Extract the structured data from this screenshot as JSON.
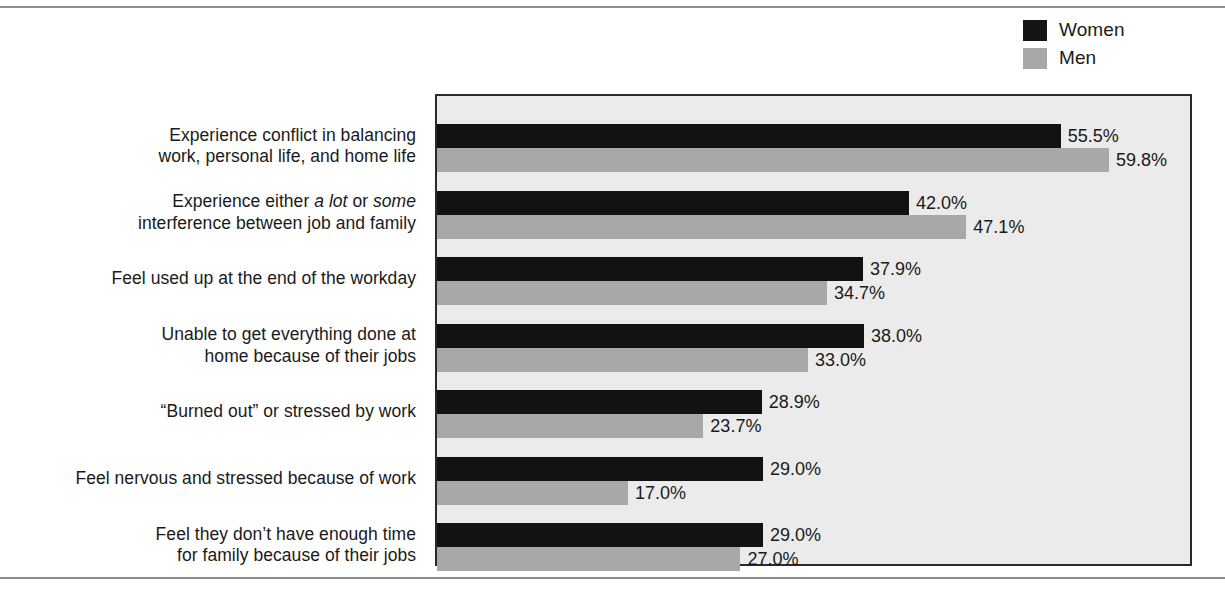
{
  "legend": {
    "entries": [
      {
        "label": "Women",
        "color": "#141414",
        "swatch": "legend-swatch-women"
      },
      {
        "label": "Men",
        "color": "#a8a8a8",
        "swatch": "legend-swatch-men"
      }
    ]
  },
  "bleed_text": {
    "right": "                    \n                \n                  \n\n                \n\n               \n            \n              \n                 \n                  \n                  \n                  ",
    "left": ""
  },
  "chart_data": {
    "type": "bar",
    "orientation": "horizontal",
    "title": "",
    "subtitle": "",
    "xlabel": "",
    "ylabel": "",
    "grid": false,
    "legend_position": "top-right",
    "xlim": [
      0,
      67
    ],
    "value_format": "percent-one-decimal",
    "categories": [
      "Experience conflict in balancing work, personal life, and home life",
      "Experience either a lot or some interference between job and family",
      "Feel used up at the end of the workday",
      "Unable to get everything done at home because of their jobs",
      "“Burned out” or stressed by work",
      "Feel nervous and stressed because of work",
      "Feel they don’t have enough time for family because of their jobs"
    ],
    "category_lines": [
      [
        "Experience conflict in balancing",
        "work, personal life, and home life"
      ],
      [
        "Experience either _a lot_ or _some_",
        "interference between job and family"
      ],
      [
        "Feel used up at the end of the workday"
      ],
      [
        "Unable to get everything done at",
        "home because of their jobs"
      ],
      [
        "“Burned out” or stressed by work"
      ],
      [
        "Feel nervous and stressed because of work"
      ],
      [
        "Feel they don’t have enough time",
        "for family because of their jobs"
      ]
    ],
    "series": [
      {
        "name": "Women",
        "color": "#121212",
        "values": [
          55.5,
          42.0,
          37.9,
          38.0,
          28.9,
          29.0,
          29.0
        ],
        "labels": [
          "55.5%",
          "42.0%",
          "37.9%",
          "38.0%",
          "28.9%",
          "29.0%",
          "29.0%"
        ]
      },
      {
        "name": "Men",
        "color": "#a8a8a8",
        "values": [
          59.8,
          47.1,
          34.7,
          33.0,
          23.7,
          17.0,
          27.0
        ],
        "labels": [
          "59.8%",
          "47.1%",
          "34.7%",
          "33.0%",
          "23.7%",
          "17.0%",
          "27.0%"
        ]
      }
    ]
  }
}
